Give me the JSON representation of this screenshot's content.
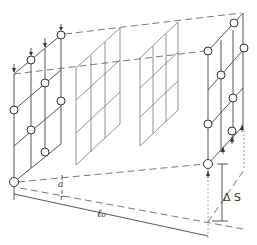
{
  "figure": {
    "labels": {
      "a": "a",
      "r": "r",
      "l0": "ℓ₀",
      "delta_s": "Δ S"
    },
    "colors": {
      "line": "#444444",
      "background": "#ffffff"
    }
  }
}
